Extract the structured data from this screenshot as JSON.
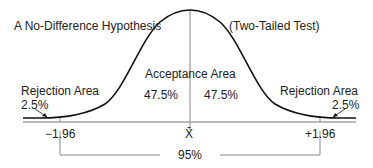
{
  "diagram": {
    "title_left": "A No-Difference Hypothesis",
    "title_right": "(Two-Tailed Test)",
    "acceptance": {
      "label": "Acceptance Area",
      "left_pct": "47.5%",
      "right_pct": "47.5%"
    },
    "rejection_left": {
      "label": "Rejection Area",
      "pct": "2.5%"
    },
    "rejection_right": {
      "label": "Rejection Area",
      "pct": "2.5%"
    },
    "axis": {
      "left_tick": "−1.96",
      "center_tick": "X̄",
      "right_tick": "+1.96"
    },
    "bracket_label": "95%",
    "colors": {
      "curve": "#111111",
      "line": "#888888",
      "text": "#222222"
    }
  }
}
